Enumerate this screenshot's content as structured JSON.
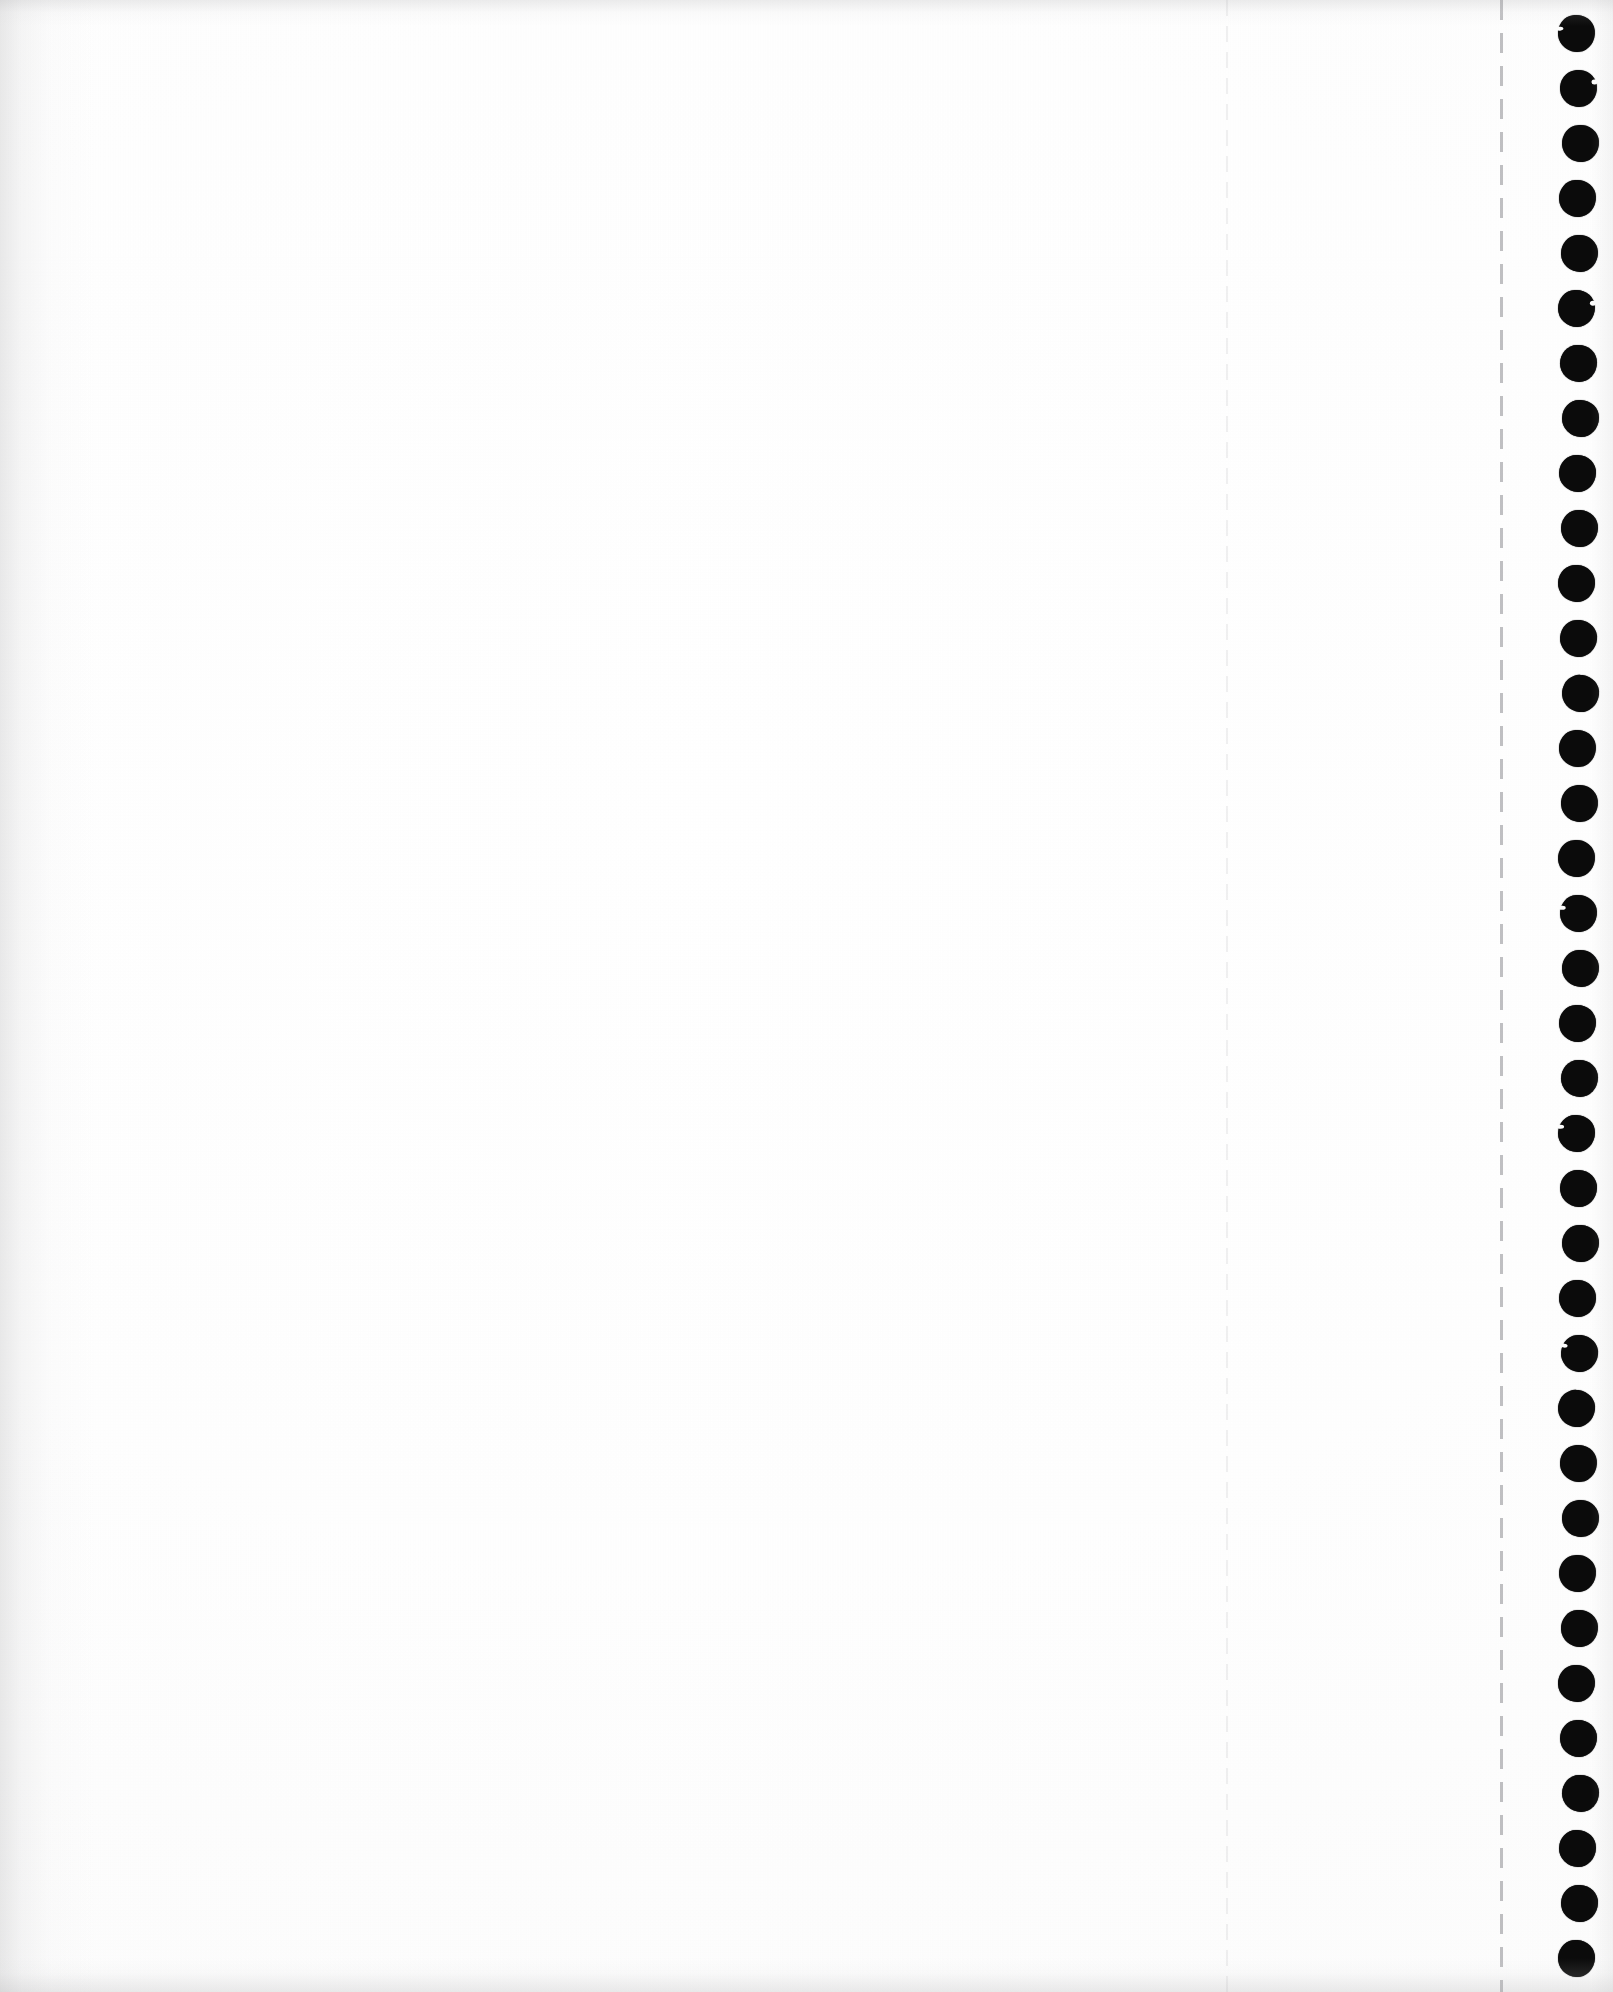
{
  "document": {
    "kind": "scanned-page",
    "media": "continuous-form tractor-feed paper",
    "page_label": "",
    "visible_text": "",
    "content_state": "blank",
    "orientation": "portrait",
    "width_px": 1613,
    "height_px": 1992
  },
  "colors": {
    "paper": "#ffffff",
    "paper_tint": "#fcfcfc",
    "sprocket_hole": "#0b0b0b",
    "perforation_dash": "#6a6a70",
    "fold_rule": "#78787e",
    "edge_shadow": "#aaaaac"
  },
  "content_area": {
    "label": "blank printable area",
    "text": "",
    "left_px": 0,
    "top_px": 0,
    "width_px": 1226,
    "height_px": 1992
  },
  "fold_rule": {
    "label": "faint fold rule",
    "x_px": 1226,
    "dash_on_px": 16,
    "dash_off_px": 10
  },
  "perforation": {
    "label": "tear-off perforation",
    "x_px": 1500,
    "dash_on_px": 20,
    "dash_off_px": 13
  },
  "sprocket_strip": {
    "label": "tractor feed margin",
    "left_px": 1502,
    "width_px": 111,
    "hole_center_x_px": 1578,
    "hole_diameter_px": 37,
    "first_hole_center_y_px": 33,
    "hole_pitch_px": 55,
    "hole_count": 36,
    "nicked_holes": [
      0,
      1,
      5,
      16,
      20,
      24
    ]
  }
}
